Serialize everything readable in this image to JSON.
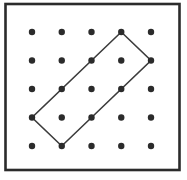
{
  "figure": {
    "name": "geoboard-dot-grid-with-rectangle",
    "grid": {
      "rows": 5,
      "cols": 5,
      "dot_radius": 3.2
    },
    "polygon": {
      "type": "tilted-rectangle",
      "vertices_grid": [
        [
          3,
          0
        ],
        [
          4,
          1
        ],
        [
          1,
          4
        ],
        [
          0,
          3
        ]
      ],
      "closed": true
    },
    "frame": {
      "stroke_width": 2.6
    },
    "colors": {
      "background": "#ffffff",
      "frame": "#2b2b2b",
      "dot": "#2b2b2b",
      "line": "#3c3c3c"
    },
    "layout_px": {
      "canvas_w": 187,
      "canvas_h": 180,
      "frame_x": 5.5,
      "frame_y": 4.0,
      "frame_w": 174.0,
      "frame_h": 166.0,
      "first_dot_x": 32,
      "first_dot_y": 32,
      "dot_spacing_x": 29.75,
      "dot_spacing_y": 28.5
    }
  }
}
